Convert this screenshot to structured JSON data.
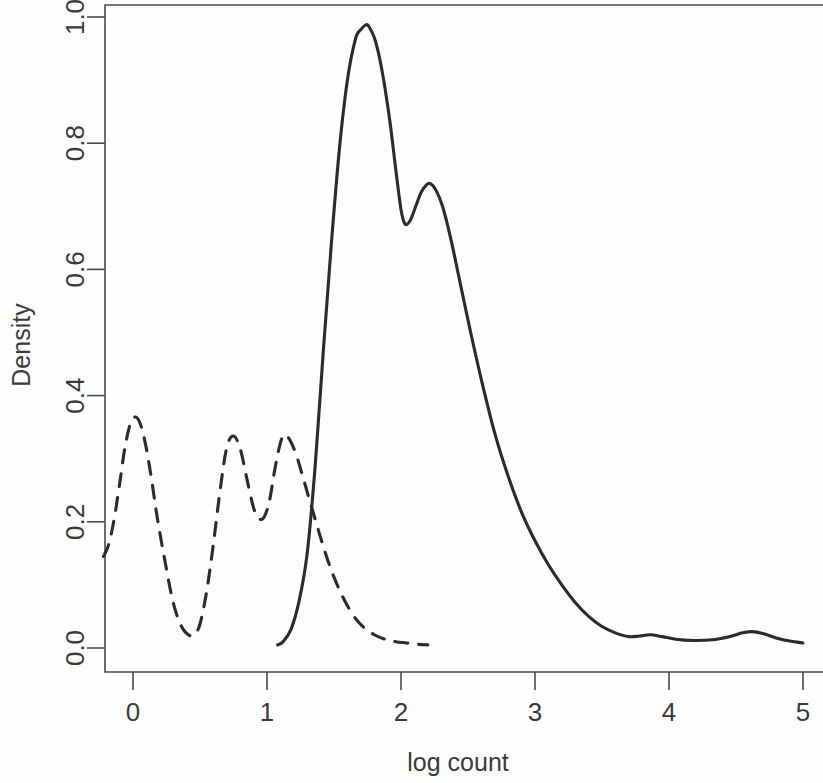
{
  "chart_data": {
    "type": "line",
    "title": "",
    "subtitle": "",
    "xlabel": "log count",
    "ylabel": "Density",
    "xlim": [
      -0.25,
      5.05
    ],
    "ylim": [
      0.0,
      1.02
    ],
    "xticks": [
      0,
      1,
      2,
      3,
      4,
      5
    ],
    "xtick_labels": [
      "0",
      "1",
      "2",
      "3",
      "4",
      "5"
    ],
    "yticks": [
      0.0,
      0.2,
      0.4,
      0.6,
      0.8,
      1.0
    ],
    "ytick_labels": [
      "0.0",
      "0.2",
      "0.4",
      "0.6",
      "0.8",
      "1.0"
    ],
    "grid": false,
    "legend": "none",
    "box_frame": true,
    "series": [
      {
        "name": "solid-density",
        "linestyle": "solid",
        "color": "#2b2b2b",
        "x": [
          1.08,
          1.12,
          1.18,
          1.24,
          1.3,
          1.36,
          1.42,
          1.48,
          1.54,
          1.6,
          1.66,
          1.7,
          1.74,
          1.76,
          1.8,
          1.84,
          1.88,
          1.92,
          1.96,
          2.0,
          2.03,
          2.07,
          2.11,
          2.15,
          2.19,
          2.22,
          2.26,
          2.31,
          2.37,
          2.44,
          2.52,
          2.6,
          2.7,
          2.8,
          2.9,
          3.0,
          3.1,
          3.2,
          3.3,
          3.4,
          3.5,
          3.6,
          3.7,
          3.78,
          3.86,
          3.95,
          4.05,
          4.18,
          4.32,
          4.45,
          4.55,
          4.62,
          4.7,
          4.8,
          4.9,
          5.0
        ],
        "y": [
          0.005,
          0.01,
          0.03,
          0.075,
          0.15,
          0.29,
          0.47,
          0.64,
          0.79,
          0.9,
          0.965,
          0.98,
          0.988,
          0.985,
          0.968,
          0.935,
          0.888,
          0.83,
          0.76,
          0.695,
          0.672,
          0.678,
          0.7,
          0.722,
          0.734,
          0.736,
          0.726,
          0.7,
          0.65,
          0.58,
          0.5,
          0.425,
          0.34,
          0.272,
          0.215,
          0.17,
          0.132,
          0.1,
          0.072,
          0.05,
          0.034,
          0.024,
          0.018,
          0.019,
          0.021,
          0.018,
          0.014,
          0.012,
          0.013,
          0.018,
          0.024,
          0.026,
          0.023,
          0.016,
          0.011,
          0.008
        ]
      },
      {
        "name": "dashed-density",
        "linestyle": "dashed",
        "color": "#2b2b2b",
        "x": [
          -0.22,
          -0.18,
          -0.14,
          -0.1,
          -0.06,
          -0.02,
          0.02,
          0.06,
          0.1,
          0.14,
          0.18,
          0.24,
          0.3,
          0.36,
          0.42,
          0.46,
          0.5,
          0.55,
          0.6,
          0.65,
          0.7,
          0.75,
          0.8,
          0.85,
          0.9,
          0.94,
          0.98,
          1.02,
          1.06,
          1.1,
          1.13,
          1.17,
          1.22,
          1.28,
          1.34,
          1.4,
          1.46,
          1.52,
          1.58,
          1.65,
          1.72,
          1.8,
          1.88,
          1.96,
          2.04,
          2.12,
          2.2
        ],
        "y": [
          0.145,
          0.165,
          0.205,
          0.26,
          0.318,
          0.355,
          0.366,
          0.352,
          0.316,
          0.265,
          0.208,
          0.136,
          0.072,
          0.035,
          0.02,
          0.022,
          0.038,
          0.09,
          0.165,
          0.25,
          0.318,
          0.336,
          0.316,
          0.268,
          0.222,
          0.205,
          0.208,
          0.235,
          0.285,
          0.325,
          0.338,
          0.33,
          0.305,
          0.262,
          0.218,
          0.175,
          0.135,
          0.102,
          0.075,
          0.05,
          0.033,
          0.021,
          0.014,
          0.01,
          0.008,
          0.006,
          0.005
        ]
      }
    ]
  },
  "axes": {
    "x_label": "log count",
    "y_label": "Density"
  }
}
